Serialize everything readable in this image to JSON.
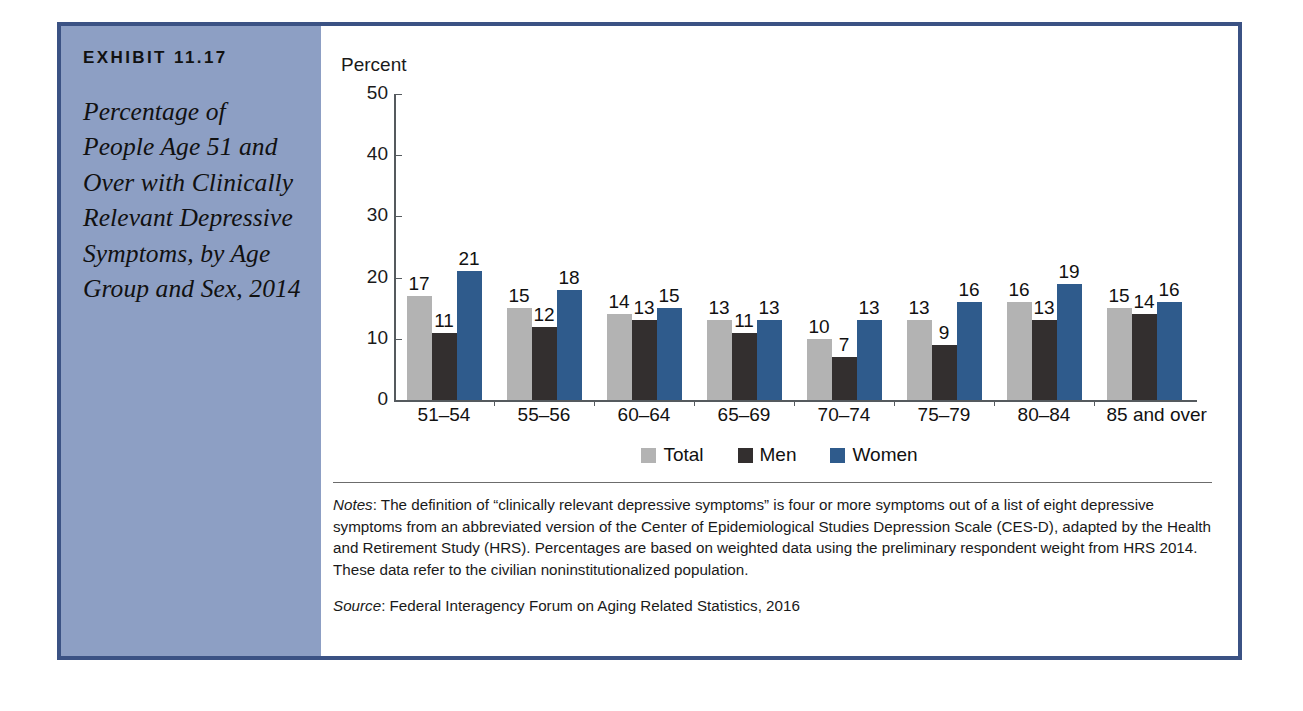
{
  "exhibit": {
    "number": "EXHIBIT 11.17",
    "title": "Percentage of People Age 51 and Over with Clinically Relevant Depressive Symptoms, by Age Group and Sex, 2014"
  },
  "notes": {
    "label": "Notes",
    "label_sep": ": ",
    "body": "The definition of “clinically relevant depressive symptoms” is four or more symptoms out of a list of eight depressive symptoms from an abbreviated version of the Center of Epidemiological Studies Depression Scale (CES-D), adapted by the Health and Retirement Study (HRS). Percentages are based on weighted data using the preliminary respondent weight from HRS 2014. These data refer to the civilian noninstitutionalized population."
  },
  "source": {
    "label": "Source",
    "label_sep": ": ",
    "body": "Federal Interagency Forum on Aging Related Statistics, 2016"
  },
  "colors": {
    "frame": "#3b5284",
    "caption_panel": "#8d9fc4",
    "total": "#b3b3b3",
    "men": "#332f2f",
    "women": "#2f5b8c"
  },
  "chart_data": {
    "type": "bar",
    "title": "",
    "xlabel": "",
    "ylabel": "Percent",
    "ylim": [
      0,
      50
    ],
    "yticks": [
      0,
      10,
      20,
      30,
      40,
      50
    ],
    "ytick_labels": [
      "0",
      "10",
      "20",
      "30",
      "40",
      "50"
    ],
    "grid": false,
    "legend_position": "bottom",
    "categories": [
      "51–54",
      "55–56",
      "60–64",
      "65–69",
      "70–74",
      "75–79",
      "80–84",
      "85 and over"
    ],
    "series": [
      {
        "name": "Total",
        "color": "#b3b3b3",
        "values": [
          17,
          15,
          14,
          13,
          10,
          13,
          16,
          15
        ]
      },
      {
        "name": "Men",
        "color": "#332f2f",
        "values": [
          11,
          12,
          13,
          11,
          7,
          9,
          13,
          14
        ]
      },
      {
        "name": "Women",
        "color": "#2f5b8c",
        "values": [
          21,
          18,
          15,
          13,
          13,
          16,
          19,
          16
        ]
      }
    ]
  }
}
